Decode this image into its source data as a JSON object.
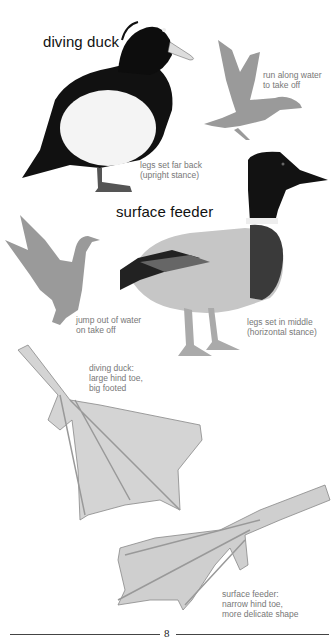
{
  "page": {
    "page_number": "8",
    "headings": {
      "diving_duck": "diving duck",
      "surface_feeder": "surface feeder"
    },
    "captions": {
      "diving_takeoff": "run along water\nto take off",
      "diving_legs": "legs set far back\n(upright stance)",
      "surface_takeoff": "jump out of water\non take off",
      "surface_legs": "legs set in middle\n(horizontal stance)",
      "diving_foot": "diving duck:\nlarge hind toe,\nbig footed",
      "surface_foot": "surface feeder:\nnarrow hind toe,\nmore delicate shape"
    },
    "illustrations": [
      "diving-duck-tufted",
      "diving-duck-takeoff-silhouette",
      "surface-feeder-mallard",
      "surface-feeder-takeoff-silhouette",
      "diving-duck-foot",
      "surface-feeder-foot"
    ],
    "colors": {
      "silhouette": "#9a9a9a",
      "caption": "#777777",
      "heading": "#111111"
    }
  }
}
